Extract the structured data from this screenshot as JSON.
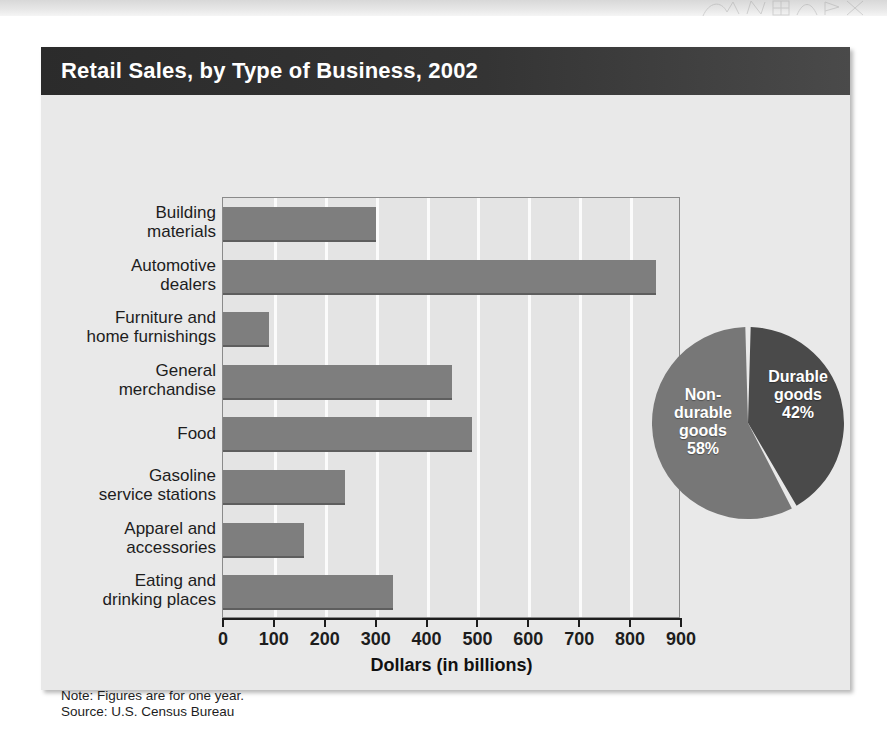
{
  "chart_title": "Retail Sales, by Type of Business, 2002",
  "axis": {
    "x_title": "Dollars (in billions)",
    "x_ticks": [
      "0",
      "100",
      "200",
      "300",
      "400",
      "500",
      "600",
      "700",
      "800",
      "900"
    ]
  },
  "footnotes": {
    "note": "Note: Figures are for one year.",
    "source": "Source:  U.S. Census Bureau"
  },
  "pie_labels": {
    "durable": "Durable\ngoods\n42%",
    "nondurable": "Non-\ndurable\ngoods\n58%"
  },
  "colors": {
    "header_bar": "#343434",
    "card_body": "#e9e9e9",
    "plot_bg": "#e4e4e4",
    "bar_fill": "#7e7e7e",
    "gridline": "#fbfbfb",
    "pie_durable": "#4a4a4a",
    "pie_nondurable": "#777777"
  },
  "chart_data": [
    {
      "type": "bar",
      "orientation": "horizontal",
      "title": "Retail Sales, by Type of Business, 2002",
      "xlabel": "Dollars (in billions)",
      "ylabel": "",
      "xlim": [
        0,
        900
      ],
      "grid": true,
      "legend": "none",
      "categories": [
        "Building\nmaterials",
        "Automotive\ndealers",
        "Furniture and\nhome furnishings",
        "General\nmerchandise",
        "Food",
        "Gasoline\nservice stations",
        "Apparel and\naccessories",
        "Eating and\ndrinking places"
      ],
      "values": [
        300,
        850,
        90,
        450,
        490,
        240,
        160,
        335
      ],
      "units": "billions of dollars"
    },
    {
      "type": "pie",
      "title": "",
      "labels": [
        "Durable goods",
        "Non-durable goods"
      ],
      "values": [
        42,
        58
      ],
      "units": "percent",
      "legend": "inside-slices"
    }
  ]
}
